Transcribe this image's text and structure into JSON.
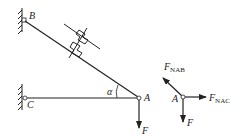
{
  "diagram": {
    "title": "",
    "structure": {
      "support_B_label": "B",
      "support_C_label": "C",
      "joint_A_label": "A",
      "angle_label": "α",
      "load_label": "F",
      "members": [
        "AB",
        "AC"
      ],
      "member_AB_note": "spring/connector element symbol on bar AB"
    },
    "free_body": {
      "point_label": "A",
      "forces": [
        {
          "name": "F",
          "sub": "NAB",
          "direction": "up-left along AB"
        },
        {
          "name": "F",
          "sub": "NAC",
          "direction": "right along CA"
        },
        {
          "name": "F",
          "sub": "",
          "direction": "down"
        }
      ]
    }
  }
}
